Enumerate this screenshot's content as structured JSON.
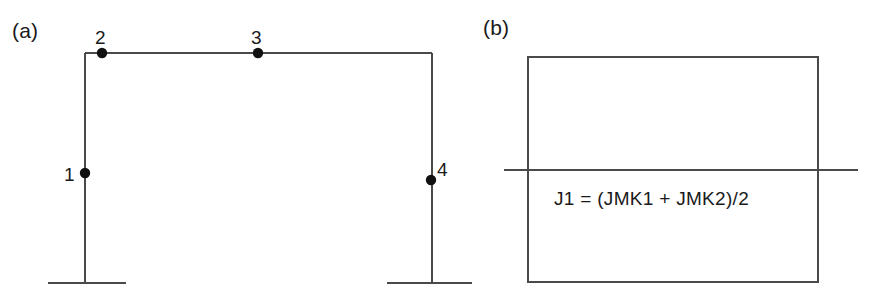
{
  "figure": {
    "background_color": "#ffffff",
    "line_color": "#4a4a4a",
    "node_color": "#111111",
    "text_color": "#1a1a1a",
    "width": 871,
    "height": 302
  },
  "panel_a": {
    "label": "(a)",
    "description": "portal frame elevation with four numbered nodes",
    "nodes": [
      {
        "id": "1",
        "label": "1",
        "x": 85,
        "y": 173,
        "label_x": 64,
        "label_y": 165,
        "label_side": "left"
      },
      {
        "id": "2",
        "label": "2",
        "x": 102,
        "y": 53,
        "label_x": 95,
        "label_y": 28,
        "label_side": "top"
      },
      {
        "id": "3",
        "label": "3",
        "x": 258,
        "y": 53,
        "label_x": 251,
        "label_y": 28,
        "label_side": "top"
      },
      {
        "id": "4",
        "label": "4",
        "x": 431,
        "y": 180,
        "label_x": 437,
        "label_y": 160,
        "label_side": "right"
      }
    ],
    "members": [
      {
        "name": "left-column",
        "x1": 85,
        "y1": 53,
        "x2": 85,
        "y2": 283
      },
      {
        "name": "top-beam",
        "x1": 85,
        "y1": 53,
        "x2": 432,
        "y2": 53
      },
      {
        "name": "right-column",
        "x1": 432,
        "y1": 53,
        "x2": 432,
        "y2": 283
      }
    ],
    "supports": [
      {
        "name": "left-support-base",
        "x1": 48,
        "y1": 283,
        "x2": 126,
        "y2": 283
      },
      {
        "name": "right-support-base",
        "x1": 387,
        "y1": 283,
        "x2": 473,
        "y2": 283
      }
    ]
  },
  "panel_b": {
    "label": "(b)",
    "description": "rectangular joint block crossed by a horizontal reference line with an averaging formula",
    "formula": "J1 = (JMK1 + JMK2)/2",
    "formula_x": 84,
    "formula_y": 189,
    "rectangle": {
      "x": 58,
      "y": 57,
      "width": 290,
      "height": 225
    },
    "crossing_line": {
      "x1": 34,
      "y1": 170,
      "x2": 388,
      "y2": 170
    },
    "stub_line": {
      "x1": -14,
      "y1": 283,
      "x2": 2,
      "y2": 283
    }
  }
}
